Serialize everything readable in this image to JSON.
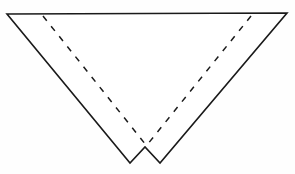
{
  "figure": {
    "canvas": {
      "width": 295,
      "height": 174
    },
    "colors": {
      "background": "#fefefe",
      "stroke": "#1a1a1a",
      "fill": "#ffffff"
    },
    "outline": {
      "name": "notched-inverted-triangle",
      "stroke_width": 1.6,
      "style": "solid",
      "points": [
        {
          "x": 7,
          "y": 14
        },
        {
          "x": 287,
          "y": 13
        },
        {
          "x": 160,
          "y": 163
        },
        {
          "x": 145,
          "y": 147
        },
        {
          "x": 130,
          "y": 163
        }
      ]
    },
    "fold_lines": [
      {
        "name": "left-fold-line",
        "style": "dashed",
        "dash_pattern": "6,7",
        "stroke_width": 1.5,
        "from": {
          "x": 43,
          "y": 16
        },
        "to": {
          "x": 146,
          "y": 145
        }
      },
      {
        "name": "right-fold-line",
        "style": "dashed",
        "dash_pattern": "6,7",
        "stroke_width": 1.5,
        "from": {
          "x": 251,
          "y": 16
        },
        "to": {
          "x": 147,
          "y": 145
        }
      }
    ]
  }
}
